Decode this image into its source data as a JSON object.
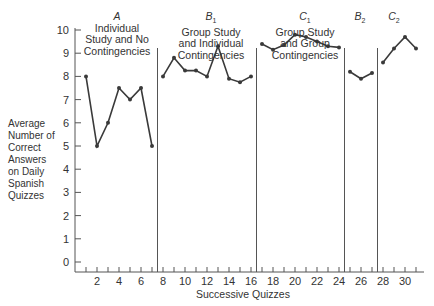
{
  "chart_data": {
    "type": "line",
    "title": "",
    "xlabel": "Successive Quizzes",
    "ylabel": "Average Number of Correct Answers on Daily Spanish Quizzes",
    "ylim": [
      0,
      10
    ],
    "xlim": [
      0,
      31
    ],
    "yticks": [
      0,
      1,
      2,
      3,
      4,
      5,
      6,
      7,
      8,
      9,
      10
    ],
    "xtick_labels": [
      2,
      4,
      6,
      8,
      10,
      12,
      14,
      16,
      18,
      20,
      22,
      24,
      26,
      28,
      30
    ],
    "grid": false,
    "phase_boundaries": [
      7.5,
      16.5,
      24.5,
      27.5
    ],
    "phases": [
      {
        "code": "A",
        "sub": "",
        "label": "Individual Study and No Contingencies",
        "x": [
          1,
          2,
          3,
          4,
          5,
          6,
          7
        ],
        "values": [
          8,
          5,
          6,
          7.5,
          7,
          7.5,
          5
        ]
      },
      {
        "code": "B",
        "sub": "1",
        "label": "Group Study and Individual Contingencies",
        "x": [
          8,
          9,
          10,
          11,
          12,
          13,
          14,
          15,
          16
        ],
        "values": [
          8,
          8.8,
          8.25,
          8.25,
          8,
          9.3,
          7.9,
          7.75,
          8
        ]
      },
      {
        "code": "C",
        "sub": "1",
        "label": "Group Study and Group Contingencies",
        "x": [
          17,
          18,
          19,
          20,
          21,
          22,
          23,
          24
        ],
        "values": [
          9.4,
          9.15,
          9.35,
          9.8,
          9.7,
          9.5,
          9.3,
          9.25
        ]
      },
      {
        "code": "B",
        "sub": "2",
        "label": "",
        "x": [
          25,
          26,
          27
        ],
        "values": [
          8.2,
          7.9,
          8.15
        ]
      },
      {
        "code": "C",
        "sub": "2",
        "label": "",
        "x": [
          28,
          29,
          30,
          31
        ],
        "values": [
          8.6,
          9.2,
          9.7,
          9.2
        ]
      }
    ]
  },
  "labels": {
    "ylabel_lines": [
      "Average",
      "Number of",
      "Correct",
      "Answers",
      "on Daily",
      "Spanish",
      "Quizzes"
    ],
    "xlabel": "Successive Quizzes",
    "phaseA": {
      "code": "A",
      "sub": "",
      "l1": "Individual",
      "l2": "Study and No",
      "l3": "Contingencies"
    },
    "phaseB1": {
      "code": "B",
      "sub": "1",
      "l1": "Group Study",
      "l2": "and Individual",
      "l3": "Contingencies"
    },
    "phaseC1": {
      "code": "C",
      "sub": "1",
      "l1": "Group Study",
      "l2": "and Group",
      "l3": "Contingencies"
    },
    "phaseB2": {
      "code": "B",
      "sub": "2"
    },
    "phaseC2": {
      "code": "C",
      "sub": "2"
    }
  },
  "colors": {
    "line": "#3a3a3a",
    "axis": "#555555",
    "text": "#333333"
  }
}
